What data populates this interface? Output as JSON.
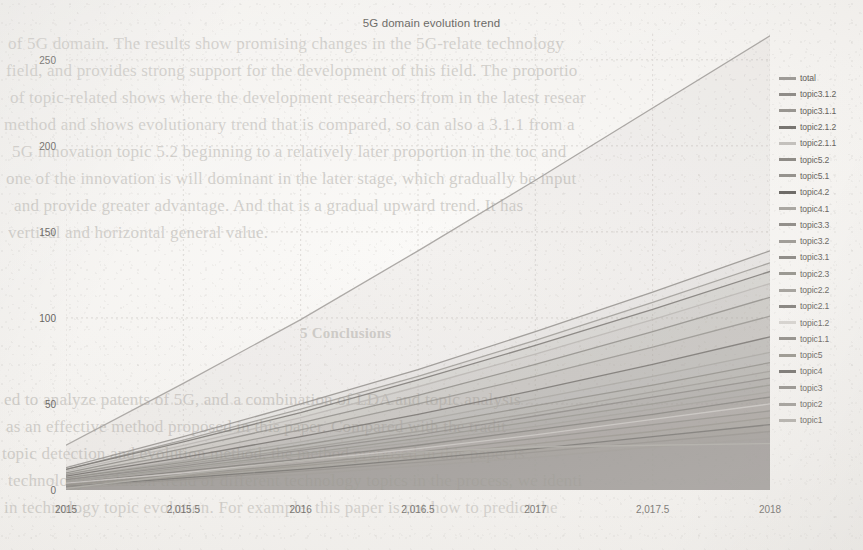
{
  "page": {
    "background_color": "#f3f1ee",
    "ink_color": "#6a6763"
  },
  "ghost_text": {
    "note": "faint bleed-through text from the reverse side of the scanned page",
    "top_block": [
      "of 5G domain. The results show promising changes in the 5G-relate technology",
      "field, and provides strong support for the development of this field. The proportio",
      "of topic-related shows where the development researchers from in the  latest resear",
      "method and shows  evolutionary trend that is compared, so can also a 3.1.1 from a",
      "5G innovation topic 5.2  beginning to a relatively later proportion in  the  toc  and",
      "one of the innovation is will dominant in the later stage, which gradually be input",
      "and provide  greater advantage. And that is a gradual upward trend. It has",
      "vertical and horizontal general value."
    ],
    "mid_block": [
      "5 Conclusions"
    ],
    "bottom_block": [
      "ed to analyze patents of 5G, and a combination of LDA and topic analysis",
      "as  an  effective method proposed in  this paper. Compared  with the  tradit",
      "topic detection and evolution method, the method proposed in this paper is",
      "technology evolution trend of different technology topics in the process, we  identi",
      "in technology topic evolution. For example, this paper is not how to  predict  the"
    ]
  },
  "chart_data": {
    "type": "line",
    "title": "5G domain evolution trend",
    "xlabel": "",
    "ylabel": "",
    "xlim": [
      2015,
      2018
    ],
    "ylim": [
      0,
      265
    ],
    "xticks": [
      2015,
      2015.5,
      2016,
      2016.5,
      2017,
      2017.5,
      2018
    ],
    "xticklabels": [
      "2015",
      "2,015.5",
      "2016",
      "2,016.5",
      "2017",
      "2,017.5",
      "2018"
    ],
    "yticks": [
      0,
      50,
      100,
      150,
      200,
      250
    ],
    "yticklabels": [
      "0",
      "50",
      "100",
      "150",
      "200",
      "250"
    ],
    "grid": true,
    "legend_position": "right",
    "x": [
      2015,
      2015.5,
      2016,
      2016.5,
      2017,
      2017.5,
      2018
    ],
    "series": [
      {
        "name": "total",
        "color": "#9d9a96",
        "values": [
          26,
          62,
          99,
          139,
          180,
          222,
          264
        ]
      },
      {
        "name": "topic3.1.2",
        "color": "#8e8b87",
        "values": [
          13,
          31,
          50,
          70,
          92,
          115,
          139
        ]
      },
      {
        "name": "topic3.1.1",
        "color": "#97948f",
        "values": [
          12,
          29,
          47,
          66,
          87,
          109,
          132
        ]
      },
      {
        "name": "topic2.1.2",
        "color": "#74716d",
        "values": [
          12,
          28,
          45,
          64,
          84,
          105,
          127
        ]
      },
      {
        "name": "topic2.1.1",
        "color": "#b6b3af",
        "values": [
          11,
          26,
          42,
          60,
          79,
          99,
          120
        ]
      },
      {
        "name": "topic5.2",
        "color": "#8a8782",
        "values": [
          10,
          24,
          39,
          55,
          73,
          92,
          112
        ]
      },
      {
        "name": "topic5.1",
        "color": "#918e89",
        "values": [
          9,
          21,
          35,
          50,
          66,
          83,
          101
        ]
      },
      {
        "name": "topic4.2",
        "color": "#6d6a66",
        "values": [
          8,
          19,
          31,
          44,
          58,
          73,
          89
        ]
      },
      {
        "name": "topic4.1",
        "color": "#a5a29d",
        "values": [
          7,
          17,
          28,
          40,
          53,
          66,
          80
        ]
      },
      {
        "name": "topic3.3",
        "color": "#8b8883",
        "values": [
          7,
          16,
          26,
          37,
          49,
          61,
          74
        ]
      },
      {
        "name": "topic3.2",
        "color": "#9a9792",
        "values": [
          6,
          15,
          24,
          34,
          45,
          57,
          69
        ]
      },
      {
        "name": "topic3.1",
        "color": "#888581",
        "values": [
          6,
          14,
          23,
          32,
          43,
          54,
          65
        ]
      },
      {
        "name": "topic2.3",
        "color": "#929089",
        "values": [
          5,
          13,
          21,
          30,
          40,
          50,
          61
        ]
      },
      {
        "name": "topic2.2",
        "color": "#9f9c97",
        "values": [
          5,
          12,
          20,
          28,
          37,
          47,
          57
        ]
      },
      {
        "name": "topic2.1",
        "color": "#7e7b77",
        "values": [
          4,
          11,
          18,
          26,
          35,
          44,
          54
        ]
      },
      {
        "name": "topic1.2",
        "color": "#cbc8c4",
        "values": [
          4,
          10,
          17,
          24,
          32,
          41,
          50
        ]
      },
      {
        "name": "topic1.1",
        "color": "#8c8984",
        "values": [
          3,
          9,
          15,
          22,
          30,
          38,
          46
        ]
      },
      {
        "name": "topic5",
        "color": "#949189",
        "values": [
          3,
          8,
          14,
          20,
          27,
          34,
          42
        ]
      },
      {
        "name": "topic4",
        "color": "#6f6c68",
        "values": [
          2,
          7,
          12,
          18,
          24,
          31,
          38
        ]
      },
      {
        "name": "topic3",
        "color": "#8f8c87",
        "values": [
          2,
          6,
          11,
          16,
          22,
          28,
          34
        ]
      },
      {
        "name": "topic2",
        "color": "#9b9893",
        "values": [
          1,
          5,
          9,
          14,
          19,
          25,
          30
        ]
      },
      {
        "name": "topic1",
        "color": "#aeaba6",
        "values": [
          1,
          9,
          17,
          22,
          25,
          26,
          27
        ]
      }
    ],
    "legend_entries": [
      {
        "label": "total",
        "color": "#9d9a96"
      },
      {
        "label": "topic3.1.2",
        "color": "#8e8b87"
      },
      {
        "label": "topic3.1.1",
        "color": "#97948f"
      },
      {
        "label": "topic2.1.2",
        "color": "#74716d"
      },
      {
        "label": "topic2.1.1",
        "color": "#c2bfbb"
      },
      {
        "label": "topic5.2",
        "color": "#8a8782"
      },
      {
        "label": "topic5.1",
        "color": "#918e89"
      },
      {
        "label": "topic4.2",
        "color": "#66635f"
      },
      {
        "label": "topic4.1",
        "color": "#a5a29d"
      },
      {
        "label": "topic3.3",
        "color": "#8b8883"
      },
      {
        "label": "topic3.2",
        "color": "#9a9792"
      },
      {
        "label": "topic3.1",
        "color": "#888581"
      },
      {
        "label": "topic2.3",
        "color": "#929089"
      },
      {
        "label": "topic2.2",
        "color": "#9f9c97"
      },
      {
        "label": "topic2.1",
        "color": "#7e7b77"
      },
      {
        "label": "topic1.2",
        "color": "#d4d1cd"
      },
      {
        "label": "topic1.1",
        "color": "#8c8984"
      },
      {
        "label": "topic5",
        "color": "#949189"
      },
      {
        "label": "topic4",
        "color": "#6f6c68"
      },
      {
        "label": "topic3",
        "color": "#8f8c87"
      },
      {
        "label": "topic2",
        "color": "#9b9893"
      },
      {
        "label": "topic1",
        "color": "#aeaba6"
      }
    ]
  }
}
